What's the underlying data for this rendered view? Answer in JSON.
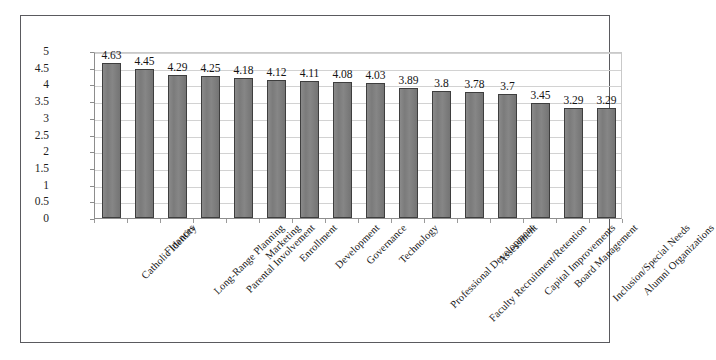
{
  "chart_data": {
    "type": "bar",
    "title": "",
    "xlabel": "",
    "ylabel": "",
    "ylim": [
      0,
      5
    ],
    "yticks": [
      "0",
      "0.5",
      "1",
      "1.5",
      "2",
      "2.5",
      "3",
      "3.5",
      "4",
      "4.5",
      "5"
    ],
    "grid": true,
    "legend": "none",
    "orientation": "vertical",
    "bar_color": "#7b7b7b",
    "bar_border_color": "#3e3e3e",
    "gridline_color": "#d2d2d2",
    "axis_color": "#8d8d8d",
    "frame_color": "#5a5a5e",
    "background": "#ffffff",
    "data_labels": true,
    "categories": [
      "Catholic Identity",
      "Finances",
      "Long-Range Planning",
      "Parental Involvement",
      "Marketing",
      "Enrollment",
      "Development",
      "Governance",
      "Technology",
      "Professional Development",
      "Faculty Recruitment/Retention",
      "Assessment",
      "Capital Improvements",
      "Board Management",
      "Inclusion/Special Needs",
      "Alumni Organizations"
    ],
    "values": [
      4.63,
      4.45,
      4.29,
      4.25,
      4.18,
      4.12,
      4.11,
      4.08,
      4.03,
      3.89,
      3.8,
      3.78,
      3.7,
      3.45,
      3.29,
      3.29
    ],
    "value_labels": [
      "4.63",
      "4.45",
      "4.29",
      "4.25",
      "4.18",
      "4.12",
      "4.11",
      "4.08",
      "4.03",
      "3.89",
      "3.8",
      "3.78",
      "3.7",
      "3.45",
      "3.29",
      "3.29"
    ]
  }
}
